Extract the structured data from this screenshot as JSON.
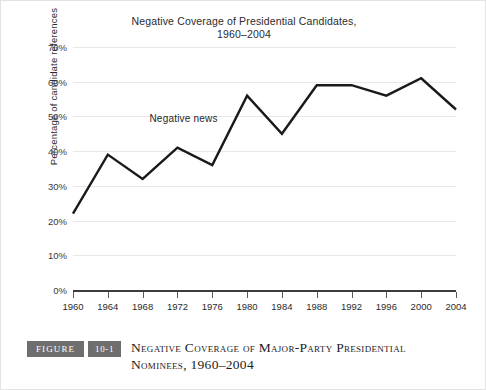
{
  "chart_data": {
    "type": "line",
    "title": "Negative Coverage of Presidential Candidates, 1960–2004",
    "title_line1": "Negative Coverage of Presidential Candidates,",
    "title_line2": "1960–2004",
    "xlabel": "",
    "ylabel": "Percentage of candidate references",
    "categories": [
      "1960",
      "1964",
      "1968",
      "1972",
      "1976",
      "1980",
      "1984",
      "1988",
      "1992",
      "1996",
      "2000",
      "2004"
    ],
    "x": [
      1960,
      1964,
      1968,
      1972,
      1976,
      1980,
      1984,
      1988,
      1992,
      1996,
      2000,
      2004
    ],
    "values": [
      22,
      39,
      32,
      41,
      36,
      56,
      45,
      59,
      59,
      56,
      61,
      52
    ],
    "series": [
      {
        "name": "Negative news",
        "values": [
          22,
          39,
          32,
          41,
          36,
          56,
          45,
          59,
          59,
          56,
          61,
          52
        ]
      }
    ],
    "ylim": [
      0,
      70
    ],
    "ytick_values": [
      0,
      10,
      20,
      30,
      40,
      50,
      60,
      70
    ],
    "ytick_labels": [
      "0%",
      "10%",
      "20%",
      "30%",
      "40%",
      "50%",
      "60%",
      "70%"
    ],
    "grid": true,
    "legend_position": "inline-annotation",
    "annotations": [
      {
        "text": "Negative news",
        "x": 1972,
        "y": 49
      }
    ],
    "line_color": "#1a1a1a",
    "grid_color": "#e8e8e8",
    "axis_color": "#3d3d3d"
  },
  "caption": {
    "badge_label": "FIGURE",
    "badge_number": "10-1",
    "line1": "Negative Coverage of Major-Party Presidential",
    "line2": "Nominees, 1960–2004",
    "badge_color": "#6e6e6e"
  }
}
